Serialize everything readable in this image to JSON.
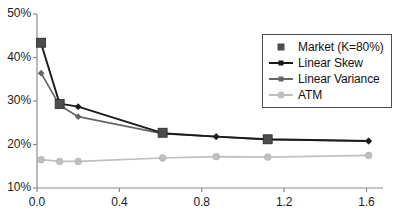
{
  "chart_data": {
    "type": "line",
    "title": "",
    "xlabel": "",
    "ylabel": "",
    "xlim": [
      0,
      1.68
    ],
    "ylim": [
      10,
      50
    ],
    "grid": false,
    "legend_position": "upper-right",
    "x_tick_labels": [
      "0.0",
      "0.4",
      "0.8",
      "1.2",
      "1.6"
    ],
    "x_ticks": [
      0.0,
      0.4,
      0.8,
      1.2,
      1.6
    ],
    "y_tick_labels": [
      "10%",
      "20%",
      "30%",
      "40%",
      "50%"
    ],
    "y_ticks": [
      10,
      20,
      30,
      40,
      50
    ],
    "x": [
      0.02,
      0.11,
      0.2,
      0.61,
      0.87,
      1.12,
      1.61
    ],
    "series": [
      {
        "name": "Market (K=80%)",
        "marker": "square",
        "color": "#4d4d4d",
        "line": false,
        "x": [
          0.02,
          0.11,
          0.61,
          1.12
        ],
        "values": [
          43.4,
          29.3,
          22.7,
          21.2
        ]
      },
      {
        "name": "Linear Skew",
        "marker": "plus",
        "color": "#1a1a1a",
        "line": true,
        "x": [
          0.02,
          0.11,
          0.2,
          0.61,
          0.87,
          1.12,
          1.61
        ],
        "values": [
          43.2,
          29.4,
          28.7,
          22.6,
          21.8,
          21.2,
          20.8
        ]
      },
      {
        "name": "Linear Variance",
        "marker": "plus",
        "color": "#666666",
        "line": true,
        "x": [
          0.02,
          0.11,
          0.2,
          0.61,
          0.87,
          1.12,
          1.61
        ],
        "values": [
          36.4,
          29.0,
          26.4,
          22.5,
          21.8,
          21.1,
          20.8
        ]
      },
      {
        "name": "ATM",
        "marker": "circle",
        "color": "#bfbfbf",
        "line": true,
        "x": [
          0.02,
          0.11,
          0.2,
          0.61,
          0.87,
          1.12,
          1.61
        ],
        "values": [
          16.5,
          16.1,
          16.1,
          16.9,
          17.2,
          17.1,
          17.5
        ]
      }
    ]
  },
  "legend": {
    "entries": [
      {
        "label": "Market (K=80%)"
      },
      {
        "label": "Linear Skew"
      },
      {
        "label": "Linear Variance"
      },
      {
        "label": "ATM"
      }
    ]
  },
  "axes": {
    "axis_color": "#8c8c8c"
  }
}
